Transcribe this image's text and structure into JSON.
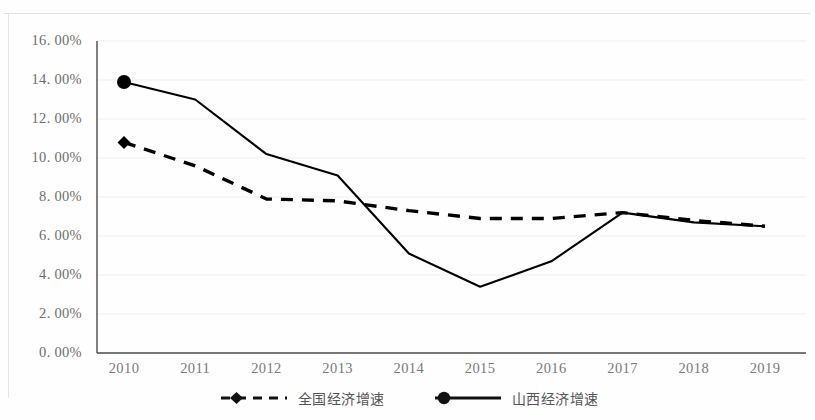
{
  "chart_data": {
    "type": "line",
    "title": "",
    "xlabel": "",
    "ylabel": "",
    "categories": [
      "2010",
      "2011",
      "2012",
      "2013",
      "2014",
      "2015",
      "2016",
      "2017",
      "2018",
      "2019"
    ],
    "series": [
      {
        "name": "全国经济增速",
        "values": [
          10.8,
          9.6,
          7.9,
          7.8,
          7.3,
          6.9,
          6.9,
          7.2,
          6.8,
          6.5
        ],
        "line_style": "dashed",
        "marker": "diamond",
        "color": "#000000"
      },
      {
        "name": "山西经济增速",
        "values": [
          13.9,
          13.0,
          10.2,
          9.1,
          5.1,
          3.4,
          4.7,
          7.2,
          6.7,
          6.5
        ],
        "line_style": "solid",
        "marker": "circle",
        "color": "#000000"
      }
    ],
    "ylim": [
      0,
      16
    ],
    "ytick_labels": [
      "16. 00%",
      "14. 00%",
      "12. 00%",
      "10. 00%",
      "8. 00%",
      "6. 00%",
      "4. 00%",
      "2. 00%",
      "0. 00%"
    ],
    "ytick_values": [
      16,
      14,
      12,
      10,
      8,
      6,
      4,
      2,
      0
    ],
    "ytick_interval": 2,
    "grid": true,
    "legend_position": "bottom",
    "value_unit": "percent"
  },
  "legend": {
    "entries": [
      {
        "label": "全国经济增速"
      },
      {
        "label": "山西经济增速"
      }
    ]
  }
}
